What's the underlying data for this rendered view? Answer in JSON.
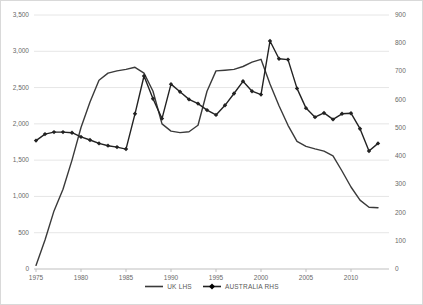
{
  "chart_data": {
    "type": "line",
    "title": "",
    "x": [
      1975,
      1976,
      1977,
      1978,
      1979,
      1980,
      1981,
      1982,
      1983,
      1984,
      1985,
      1986,
      1987,
      1988,
      1989,
      1990,
      1991,
      1992,
      1993,
      1994,
      1995,
      1996,
      1997,
      1998,
      1999,
      2000,
      2001,
      2002,
      2003,
      2004,
      2005,
      2006,
      2007,
      2008,
      2009,
      2010,
      2011,
      2012,
      2013
    ],
    "series": [
      {
        "name": "UK LHS",
        "axis": "left",
        "marker": "none",
        "color": "#3a3a3a",
        "values": [
          50,
          400,
          800,
          1100,
          1500,
          1950,
          2300,
          2600,
          2700,
          2730,
          2750,
          2780,
          2700,
          2450,
          2000,
          1900,
          1880,
          1890,
          1980,
          2450,
          2730,
          2740,
          2750,
          2790,
          2850,
          2890,
          2550,
          2250,
          1980,
          1760,
          1690,
          1655,
          1625,
          1560,
          1350,
          1130,
          950,
          850,
          845
        ]
      },
      {
        "name": "AUSTRALIA RHS",
        "axis": "right",
        "marker": "diamond",
        "color": "#222222",
        "values": [
          455,
          478,
          485,
          485,
          483,
          468,
          457,
          445,
          437,
          432,
          425,
          550,
          684,
          603,
          533,
          655,
          628,
          601,
          586,
          563,
          546,
          580,
          622,
          665,
          630,
          618,
          808,
          745,
          742,
          640,
          570,
          538,
          553,
          530,
          550,
          552,
          497,
          418,
          445
        ]
      }
    ],
    "left_axis": {
      "min": 0,
      "max": 3500,
      "step": 500,
      "tick_labels": [
        "3,500",
        "3,000",
        "2,500",
        "2,000",
        "1,500",
        "1,000",
        "500",
        "0"
      ]
    },
    "right_axis": {
      "min": 0,
      "max": 900,
      "step": 100,
      "tick_labels": [
        "900",
        "800",
        "700",
        "600",
        "500",
        "400",
        "300",
        "200",
        "100",
        "0"
      ]
    },
    "x_axis": {
      "tick_labels": [
        "1975",
        "1980",
        "1985",
        "1990",
        "1995",
        "2000",
        "2005",
        "2010"
      ],
      "tick_years": [
        1975,
        1980,
        1985,
        1990,
        1995,
        2000,
        2005,
        2010
      ]
    },
    "grid": true,
    "legend_position": "bottom"
  },
  "colors": {
    "gridline": "#e6e6e6",
    "axis_line": "#bfbfbf",
    "tick_label": "#696969",
    "background": "#ffffff",
    "frame_border": "#d9d9d9"
  }
}
